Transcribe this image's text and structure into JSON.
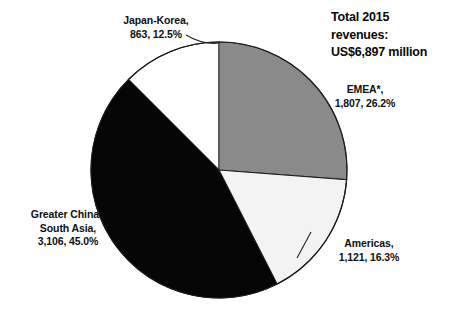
{
  "figure": {
    "note": "Total 2015\nrevenues:\nUS$6,897 million",
    "note_lines": [
      "Total 2015",
      "revenues:",
      "US$6,897 million"
    ]
  },
  "chart_data": {
    "type": "pie",
    "title": "Total 2015 revenues: US$6,897 million",
    "xlabel": "",
    "ylabel": "",
    "total_value": 6897,
    "total_label": "US$6,897 million",
    "currency_unit": "US$ million",
    "year": 2015,
    "start_angle_deg": 0,
    "direction": "clockwise",
    "legend": "none",
    "grid": false,
    "labels_placement": "outside-with-leader-lines",
    "categories": [
      "EMEA*",
      "Americas",
      "Greater China - South Asia",
      "Japan-Korea"
    ],
    "values": [
      1807,
      1121,
      3106,
      863
    ],
    "percents": [
      26.2,
      16.3,
      45.0,
      12.5
    ],
    "colors": [
      "#8a8a8a",
      "#f3f3f3",
      "#050505",
      "#ffffff"
    ],
    "slices": [
      {
        "name": "EMEA*",
        "value": 1807,
        "percent": 26.2,
        "color": "#8a8a8a",
        "label_lines": [
          "EMEA*,",
          "1,807, 26.2%"
        ],
        "label_text": "EMEA*, 1,807, 26.2%",
        "has_leader_line": false
      },
      {
        "name": "Americas",
        "value": 1121,
        "percent": 16.3,
        "color": "#f3f3f3",
        "label_lines": [
          "Americas,",
          "1,121, 16.3%"
        ],
        "label_text": "Americas, 1,121, 16.3%",
        "has_leader_line": true
      },
      {
        "name": "Greater China - South Asia",
        "value": 3106,
        "percent": 45.0,
        "color": "#050505",
        "label_lines": [
          "Greater China -",
          "South Asia,",
          "3,106, 45.0%"
        ],
        "label_text": "Greater China - South Asia, 3,106, 45.0%",
        "has_leader_line": false
      },
      {
        "name": "Japan-Korea",
        "value": 863,
        "percent": 12.5,
        "color": "#ffffff",
        "label_lines": [
          "Japan-Korea,",
          "863, 12.5%"
        ],
        "label_text": "Japan-Korea, 863, 12.5%",
        "has_leader_line": true
      }
    ],
    "footnote_marker": "*"
  },
  "labels": {
    "japan_korea": "Japan-Korea,\n863, 12.5%",
    "emea": "EMEA*,\n1,807, 26.2%",
    "americas": "Americas,\n1,121, 16.3%",
    "greater_china": "Greater China -\nSouth Asia,\n3,106, 45.0%"
  }
}
